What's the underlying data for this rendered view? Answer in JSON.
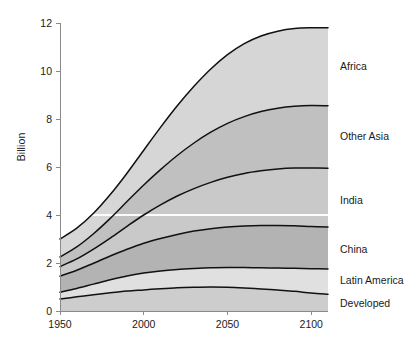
{
  "chart_data": {
    "type": "area",
    "title": "",
    "subtitle": "",
    "xlabel": "",
    "ylabel": "Billion",
    "xlim": [
      1950,
      2110
    ],
    "ylim": [
      0,
      12
    ],
    "xticks": [
      1950,
      2000,
      2050,
      2100
    ],
    "yticks": [
      0,
      2,
      4,
      6,
      8,
      10,
      12
    ],
    "grid": "single faint white horizontal line at y = 4",
    "legend_position": "right-of-plot inline labels",
    "stacked": true,
    "stack_order_bottom_to_top": [
      "Developed",
      "Latin America",
      "China",
      "India",
      "Other Asia",
      "Africa"
    ],
    "x": [
      1950,
      1960,
      1970,
      1980,
      1990,
      2000,
      2010,
      2020,
      2030,
      2040,
      2050,
      2060,
      2070,
      2080,
      2090,
      2100,
      2110
    ],
    "series": [
      {
        "name": "Developed",
        "color": "#cdcdcd",
        "cumulative_top": [
          0.5,
          0.59,
          0.68,
          0.76,
          0.83,
          0.88,
          0.93,
          0.97,
          0.99,
          1.0,
          0.99,
          0.96,
          0.92,
          0.87,
          0.82,
          0.75,
          0.7
        ]
      },
      {
        "name": "Latin America",
        "color": "#e0e0e0",
        "cumulative_top": [
          0.78,
          0.94,
          1.12,
          1.3,
          1.46,
          1.58,
          1.67,
          1.73,
          1.77,
          1.8,
          1.81,
          1.81,
          1.8,
          1.79,
          1.78,
          1.76,
          1.75
        ]
      },
      {
        "name": "China",
        "color": "#b3b3b3",
        "cumulative_top": [
          1.45,
          1.7,
          1.99,
          2.29,
          2.57,
          2.82,
          3.02,
          3.19,
          3.33,
          3.43,
          3.5,
          3.54,
          3.56,
          3.56,
          3.55,
          3.52,
          3.5
        ]
      },
      {
        "name": "India",
        "color": "#c9c9c9",
        "cumulative_top": [
          1.85,
          2.17,
          2.58,
          3.04,
          3.53,
          4.0,
          4.42,
          4.79,
          5.1,
          5.36,
          5.57,
          5.73,
          5.84,
          5.92,
          5.96,
          5.96,
          5.95
        ]
      },
      {
        "name": "Other Asia",
        "color": "#c0c0c0",
        "cumulative_top": [
          2.25,
          2.67,
          3.22,
          3.86,
          4.56,
          5.25,
          5.89,
          6.48,
          7.0,
          7.45,
          7.82,
          8.1,
          8.31,
          8.45,
          8.53,
          8.56,
          8.55
        ]
      },
      {
        "name": "Africa",
        "color": "#d6d6d6",
        "cumulative_top": [
          3.0,
          3.45,
          4.07,
          4.85,
          5.74,
          6.7,
          7.65,
          8.55,
          9.36,
          10.08,
          10.68,
          11.14,
          11.46,
          11.66,
          11.77,
          11.8,
          11.8
        ]
      }
    ]
  },
  "axes": {
    "y_axis_title": "Billion",
    "y_tick_labels": [
      "0",
      "2",
      "4",
      "6",
      "8",
      "10",
      "12"
    ],
    "x_tick_labels": [
      "1950",
      "2000",
      "2050",
      "2100"
    ]
  },
  "labels": {
    "africa": "Africa",
    "other_asia": "Other Asia",
    "india": "India",
    "china": "China",
    "latin_america": "Latin America",
    "developed": "Developed"
  },
  "colors": {
    "axis": "#8a8a8a",
    "line": "#111111",
    "text": "#1a1a1a",
    "background": "#ffffff",
    "gridline": "#ffffff"
  }
}
